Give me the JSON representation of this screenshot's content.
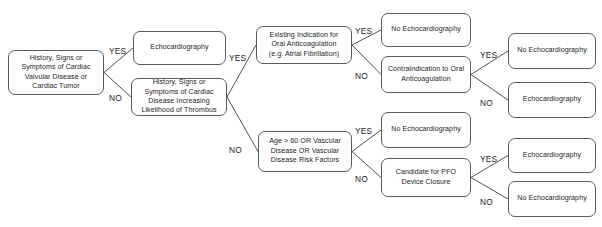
{
  "diagram": {
    "colors": {
      "node_border": "#5b5b5b",
      "node_fill": "#ffffff",
      "text": "#1d1d1d",
      "edge": "#3c3c3c",
      "background": "#ffffff"
    },
    "nodes": [
      {
        "id": "root",
        "label": "History, Signs or\nSymptoms of Cardiac\nValvular Disease or\nCardiac Tumor",
        "x": 8,
        "y": 50,
        "w": 96,
        "h": 45
      },
      {
        "id": "echo1",
        "label": "Echocardiography",
        "x": 133,
        "y": 31,
        "w": 93,
        "h": 34
      },
      {
        "id": "thrombus",
        "label": "History, Signs or\nSymptoms of Cardiac\nDisease Increasing\nLikelihood of Thrombus",
        "x": 131,
        "y": 78,
        "w": 96,
        "h": 38
      },
      {
        "id": "oac",
        "label": "Existing Indication for\nOral Anticoagulation\n(e.g. Atrial Fibrillation)",
        "x": 256,
        "y": 26,
        "w": 96,
        "h": 38
      },
      {
        "id": "noecho1",
        "label": "No Echocardiography",
        "x": 381,
        "y": 13,
        "w": 90,
        "h": 34
      },
      {
        "id": "contra",
        "label": "Contraindication to Oral\nAnticoagulation",
        "x": 381,
        "y": 56,
        "w": 90,
        "h": 37
      },
      {
        "id": "noecho2",
        "label": "No Echocardiography",
        "x": 508,
        "y": 33,
        "w": 88,
        "h": 36
      },
      {
        "id": "echo2",
        "label": "Echocardiography",
        "x": 508,
        "y": 82,
        "w": 88,
        "h": 36
      },
      {
        "id": "age",
        "label": "Age > 60 OR Vascular\nDisease OR Vascular\nDisease Risk Factors",
        "x": 258,
        "y": 131,
        "w": 94,
        "h": 41
      },
      {
        "id": "noecho3",
        "label": "No Echocardiography",
        "x": 381,
        "y": 112,
        "w": 90,
        "h": 36
      },
      {
        "id": "pfo",
        "label": "Candidate for PFO\nDevice Closure",
        "x": 381,
        "y": 158,
        "w": 90,
        "h": 39
      },
      {
        "id": "echo3",
        "label": "Echocardiography",
        "x": 508,
        "y": 138,
        "w": 88,
        "h": 35
      },
      {
        "id": "noecho4",
        "label": "No Echocardiography",
        "x": 508,
        "y": 181,
        "w": 88,
        "h": 36
      }
    ],
    "edges": [
      {
        "id": "root-yes",
        "from": "root",
        "to": "echo1",
        "label": "YES",
        "path": "M 104,72.5 L 133,48",
        "lx": 109,
        "ly": 46
      },
      {
        "id": "root-no",
        "from": "root",
        "to": "thrombus",
        "label": "NO",
        "path": "M 104,72.5 L 131,97",
        "lx": 109,
        "ly": 93
      },
      {
        "id": "thrombus-yes",
        "from": "thrombus",
        "to": "oac",
        "label": "YES",
        "path": "M 227,97 L 256,45",
        "lx": 229,
        "ly": 53
      },
      {
        "id": "thrombus-no",
        "from": "thrombus",
        "to": "age",
        "label": "NO",
        "path": "M 227,97 L 258,151.5",
        "lx": 229,
        "ly": 145
      },
      {
        "id": "oac-yes",
        "from": "oac",
        "to": "noecho1",
        "label": "YES",
        "path": "M 352,45 L 381,30",
        "lx": 355,
        "ly": 26
      },
      {
        "id": "oac-no",
        "from": "oac",
        "to": "contra",
        "label": "NO",
        "path": "M 352,45 L 381,74.5",
        "lx": 355,
        "ly": 71
      },
      {
        "id": "contra-yes",
        "from": "contra",
        "to": "noecho2",
        "label": "YES",
        "path": "M 471,74.5 L 508,51",
        "lx": 480,
        "ly": 50
      },
      {
        "id": "contra-no",
        "from": "contra",
        "to": "echo2",
        "label": "NO",
        "path": "M 471,74.5 L 508,100",
        "lx": 480,
        "ly": 98
      },
      {
        "id": "age-yes",
        "from": "age",
        "to": "noecho3",
        "label": "YES",
        "path": "M 352,151.5 L 381,130",
        "lx": 355,
        "ly": 126
      },
      {
        "id": "age-no",
        "from": "age",
        "to": "pfo",
        "label": "NO",
        "path": "M 352,151.5 L 381,177.5",
        "lx": 355,
        "ly": 174
      },
      {
        "id": "pfo-yes",
        "from": "pfo",
        "to": "echo3",
        "label": "YES",
        "path": "M 471,177.5 L 508,155.5",
        "lx": 480,
        "ly": 154
      },
      {
        "id": "pfo-no",
        "from": "pfo",
        "to": "noecho4",
        "label": "NO",
        "path": "M 471,177.5 L 508,199",
        "lx": 480,
        "ly": 197
      }
    ]
  }
}
